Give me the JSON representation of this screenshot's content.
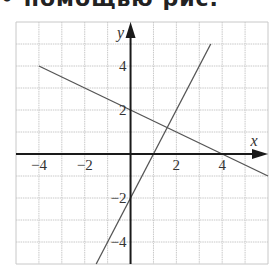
{
  "header": {
    "text": "• помощью рис."
  },
  "chart_data": {
    "type": "line",
    "title": "",
    "xlabel": "x",
    "ylabel": "y",
    "xlim": [
      -5,
      6
    ],
    "ylim": [
      -5,
      6
    ],
    "grid": true,
    "x_ticks": [
      {
        "value": -4,
        "label": "−4"
      },
      {
        "value": -2,
        "label": "−2"
      },
      {
        "value": 2,
        "label": "2"
      },
      {
        "value": 4,
        "label": "4"
      }
    ],
    "y_ticks": [
      {
        "value": 4,
        "label": "4"
      },
      {
        "value": 2,
        "label": "2"
      },
      {
        "value": -2,
        "label": "−2"
      },
      {
        "value": -4,
        "label": "−4"
      }
    ],
    "series": [
      {
        "name": "line1",
        "equation": "y = -0.5x + 2",
        "points": [
          [
            -4,
            4
          ],
          [
            6,
            -1
          ]
        ]
      },
      {
        "name": "line2",
        "equation": "y = 2x - 2",
        "points": [
          [
            -1.5,
            -5
          ],
          [
            3.5,
            5
          ]
        ]
      }
    ],
    "colors": {
      "grid": "#c8c8c8",
      "axis": "#1a1a1a",
      "lines": "#555555"
    }
  }
}
